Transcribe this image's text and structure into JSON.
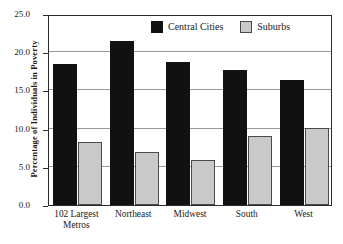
{
  "chart_data": {
    "type": "bar",
    "title": "",
    "xlabel": "",
    "ylabel": "Percentage of Individuals in Poverty",
    "categories": [
      "102 Largest\nMetros",
      "Northeast",
      "Midwest",
      "South",
      "West"
    ],
    "series": [
      {
        "name": "Central Cities",
        "values": [
          18.4,
          21.5,
          18.7,
          17.7,
          16.4
        ],
        "color": "#111111"
      },
      {
        "name": "Suburbs",
        "values": [
          8.2,
          7.0,
          5.9,
          9.0,
          10.1
        ],
        "color": "#c9c9c9"
      }
    ],
    "ylim": [
      0.0,
      25.0
    ],
    "ytick_values": [
      0.0,
      5.0,
      10.0,
      15.0,
      20.0,
      25.0
    ],
    "ytick_labels": [
      "0.0",
      "5.0",
      "10.0",
      "15.0",
      "20.0",
      "25.0"
    ],
    "grid": "horizontal",
    "legend_position": "top-center"
  }
}
